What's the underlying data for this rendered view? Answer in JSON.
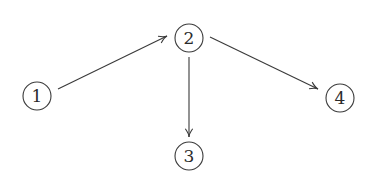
{
  "diagram": {
    "type": "directed-graph",
    "colors": {
      "stroke": "#3a3a3a",
      "text": "#2a2a2a",
      "background": "#ffffff"
    },
    "nodes": [
      {
        "id": "1",
        "label": "1",
        "cx": 37,
        "cy": 96,
        "r": 14
      },
      {
        "id": "2",
        "label": "2",
        "cx": 189,
        "cy": 38,
        "r": 14
      },
      {
        "id": "3",
        "label": "3",
        "cx": 189,
        "cy": 156,
        "r": 14
      },
      {
        "id": "4",
        "label": "4",
        "cx": 340,
        "cy": 98,
        "r": 14
      }
    ],
    "edges": [
      {
        "from": "1",
        "to": "2",
        "x1": 58,
        "y1": 89,
        "x2": 167,
        "y2": 36
      },
      {
        "from": "2",
        "to": "3",
        "x1": 189,
        "y1": 57,
        "x2": 189,
        "y2": 137
      },
      {
        "from": "2",
        "to": "4",
        "x1": 210,
        "y1": 37,
        "x2": 318,
        "y2": 89
      }
    ]
  }
}
